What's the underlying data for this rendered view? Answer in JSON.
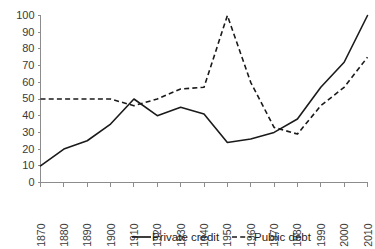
{
  "chart_data": {
    "type": "line",
    "title": "",
    "subtitle": "",
    "xlabel": "",
    "ylabel": "",
    "x": [
      1870,
      1880,
      1890,
      1900,
      1910,
      1920,
      1930,
      1940,
      1950,
      1960,
      1970,
      1980,
      1990,
      2000,
      2010
    ],
    "categories": [
      "1870",
      "1880",
      "1890",
      "1900",
      "1910",
      "1920",
      "1930",
      "1940",
      "1950",
      "1960",
      "1970",
      "1980",
      "1990",
      "2000",
      "2010"
    ],
    "series": [
      {
        "name": "Private credit",
        "style": "solid",
        "color": "#1a1a1a",
        "values": [
          10,
          20,
          25,
          35,
          50,
          40,
          45,
          41,
          24,
          26,
          30,
          38,
          57,
          72,
          100
        ]
      },
      {
        "name": "Public debt",
        "style": "dashed",
        "color": "#1a1a1a",
        "values": [
          50,
          50,
          50,
          50,
          46,
          50,
          56,
          57,
          100,
          60,
          33,
          29,
          46,
          57,
          75
        ]
      }
    ],
    "xlim": [
      1870,
      2010
    ],
    "ylim": [
      0,
      100
    ],
    "yticks": [
      0,
      10,
      20,
      30,
      40,
      50,
      60,
      70,
      80,
      90,
      100
    ],
    "ytick_labels": [
      "0",
      "10",
      "20",
      "30",
      "40",
      "50",
      "60",
      "70",
      "80",
      "90",
      "100"
    ],
    "xtick_labels": [
      "1870",
      "1880",
      "1890",
      "1900",
      "1910",
      "1920",
      "1930",
      "1940",
      "1950",
      "1960",
      "1970",
      "1980",
      "1990",
      "2000",
      "2010"
    ],
    "xtick_rotation": 90,
    "grid": false,
    "legend_position": "bottom-center",
    "legend": [
      "Private credit",
      "Public debt"
    ]
  },
  "legend": {
    "entries": [
      {
        "label": "Private credit",
        "style": "solid"
      },
      {
        "label": "Public debt",
        "style": "dashed"
      }
    ]
  }
}
